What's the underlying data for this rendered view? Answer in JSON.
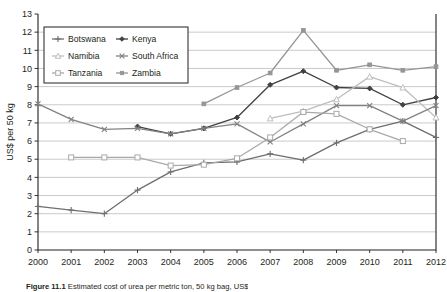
{
  "figure": {
    "caption_label": "Figure 11.1",
    "caption_text": "Estimated cost of urea per metric ton, 50 kg bag, US$"
  },
  "chart_data": {
    "type": "line",
    "title": "",
    "xlabel": "",
    "ylabel": "US$ per 50 kg",
    "x": [
      2000,
      2001,
      2002,
      2003,
      2004,
      2005,
      2006,
      2007,
      2008,
      2009,
      2010,
      2011,
      2012
    ],
    "categories": [
      "2000",
      "2001",
      "2002",
      "2003",
      "2004",
      "2005",
      "2006",
      "2007",
      "2008",
      "2009",
      "2010",
      "2011",
      "2012"
    ],
    "xlim": [
      2000,
      2012
    ],
    "ylim": [
      0,
      13
    ],
    "yticks": [
      0,
      1,
      2,
      3,
      4,
      5,
      6,
      7,
      8,
      9,
      10,
      11,
      12,
      13
    ],
    "grid": true,
    "grid_axis": "y",
    "legend_position": "upper-left",
    "series": [
      {
        "name": "Botswana",
        "color": "#6d6e71",
        "marker": "plus",
        "values": [
          2.4,
          2.2,
          2.0,
          3.3,
          4.3,
          4.8,
          4.85,
          5.3,
          4.95,
          5.9,
          6.65,
          7.1,
          6.2
        ]
      },
      {
        "name": "Kenya",
        "color": "#414042",
        "marker": "diamond",
        "values": [
          null,
          null,
          null,
          6.8,
          6.4,
          6.7,
          7.3,
          9.1,
          9.85,
          8.95,
          8.9,
          8.0,
          8.4
        ]
      },
      {
        "name": "Namibia",
        "color": "#bcbec0",
        "marker": "triangle",
        "values": [
          null,
          null,
          null,
          null,
          null,
          null,
          null,
          7.25,
          7.65,
          8.3,
          9.55,
          8.95,
          7.3
        ]
      },
      {
        "name": "South Africa",
        "color": "#808285",
        "marker": "cross",
        "values": [
          8.05,
          7.2,
          6.65,
          6.7,
          6.4,
          6.7,
          6.95,
          5.95,
          6.95,
          7.95,
          7.95,
          7.1,
          7.95
        ]
      },
      {
        "name": "Tanzania",
        "color": "#a7a9ac",
        "marker": "square",
        "values": [
          null,
          5.1,
          5.1,
          5.1,
          4.65,
          4.7,
          5.05,
          6.2,
          7.6,
          7.5,
          6.65,
          6.0,
          null
        ]
      },
      {
        "name": "Zambia",
        "color": "#939598",
        "marker": "dot",
        "values": [
          null,
          null,
          null,
          null,
          null,
          8.05,
          8.95,
          9.75,
          12.1,
          9.9,
          10.2,
          9.9,
          10.1
        ]
      }
    ]
  }
}
